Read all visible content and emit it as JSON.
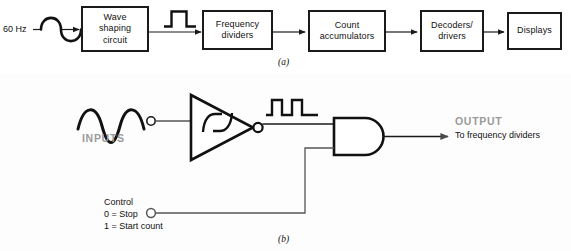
{
  "figure": {
    "title_hidden": "Digital clock / frequency counter block diagram",
    "captions": {
      "a": "(a)",
      "b": "(b)"
    },
    "colors": {
      "line": "#1a1a1a",
      "text": "#111111",
      "accent_gray": "#9a9a9a",
      "panel_a_bg": "#ffffff",
      "panel_b_bg": "#fdfdfd"
    }
  },
  "panel_a": {
    "source_label": "60 Hz",
    "waveform_icons": [
      {
        "name": "sine-wave-icon",
        "position": "after-source"
      },
      {
        "name": "square-pulse-icon",
        "position": "after-wave-shaping"
      }
    ],
    "blocks": [
      {
        "label": "Wave\nshaping\ncircuit",
        "name": "wave-shaping-circuit"
      },
      {
        "label": "Frequency\ndividers",
        "name": "frequency-dividers"
      },
      {
        "label": "Count\naccumulators",
        "name": "count-accumulators"
      },
      {
        "label": "Decoders/\ndrivers",
        "name": "decoders-drivers"
      },
      {
        "label": "Displays",
        "name": "displays"
      }
    ]
  },
  "panel_b": {
    "inputs_label": "INPUTS",
    "output_label": "OUTPUT",
    "output_sub_label": "To frequency dividers",
    "control_label": "Control\n0 = Stop\n1 = Start count",
    "gates": [
      {
        "name": "schmitt-trigger-inverter",
        "type": "inverter-with-hysteresis"
      },
      {
        "name": "and-gate",
        "type": "and"
      }
    ],
    "waveform_icons": [
      {
        "name": "sine-wave-icon",
        "position": "inverter-input"
      },
      {
        "name": "pulse-train-icon",
        "position": "inverter-output"
      }
    ]
  }
}
